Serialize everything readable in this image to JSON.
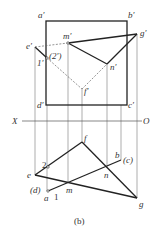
{
  "caption": "(b)",
  "axis": {
    "left": "X",
    "right": "O"
  },
  "front_view_labels": {
    "a": "a′",
    "b": "b′",
    "c": "c′",
    "d": "d′",
    "e": "e′",
    "f": "f′",
    "g": "g′",
    "m": "m′",
    "n": "n′",
    "p1": "1′",
    "p2": "(2′)"
  },
  "top_view_labels": {
    "e": "e",
    "f": "f",
    "g": "g",
    "m": "m",
    "n": "n",
    "b": "b",
    "c": "(c)",
    "a": "a",
    "d": "(d)",
    "p1": "1",
    "p2": "2"
  },
  "colors": {
    "line": "#222222",
    "thin": "#555555",
    "hidden": "#666666"
  }
}
